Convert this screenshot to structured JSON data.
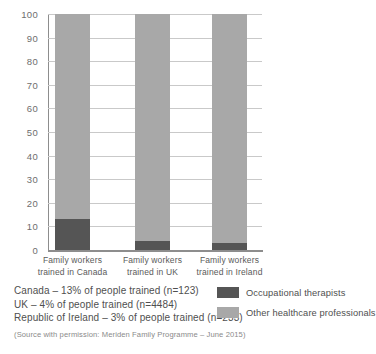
{
  "chart_data": {
    "type": "bar",
    "stacked": true,
    "title": "",
    "xlabel": "",
    "ylabel": "",
    "ylim": [
      0,
      100
    ],
    "yticks": [
      100,
      90,
      80,
      70,
      60,
      50,
      40,
      30,
      20,
      10,
      0
    ],
    "grid": true,
    "categories": [
      "Family workers trained in Canada",
      "Family workers trained in UK",
      "Family workers trained in Ireland"
    ],
    "series": [
      {
        "name": "Occupational therapists",
        "values": [
          13,
          4,
          3
        ],
        "color": "#555555"
      },
      {
        "name": "Other healthcare professionals",
        "values": [
          87,
          96,
          97
        ],
        "color": "#a8a8a8"
      }
    ],
    "legend_position": "bottom-right"
  },
  "notes": [
    "Canada – 13% of people trained (n=123)",
    "UK – 4% of people trained (n=4484)",
    "Republic of Ireland – 3% of people trained (n=233)"
  ],
  "source": "(Source with permission: Meriden Family Programme – June 2015)",
  "colors": {
    "occupational_therapists": "#555555",
    "other_healthcare_professionals": "#a8a8a8",
    "gridline": "#c9c9c9",
    "axis": "#8d8d8d"
  }
}
